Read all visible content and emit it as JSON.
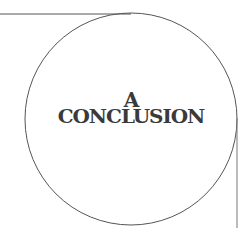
{
  "heading": {
    "line1": "A",
    "line2": "CONCLUSION"
  },
  "colors": {
    "text": "#3a3a3a",
    "stroke": "#555555",
    "background": "#ffffff"
  }
}
